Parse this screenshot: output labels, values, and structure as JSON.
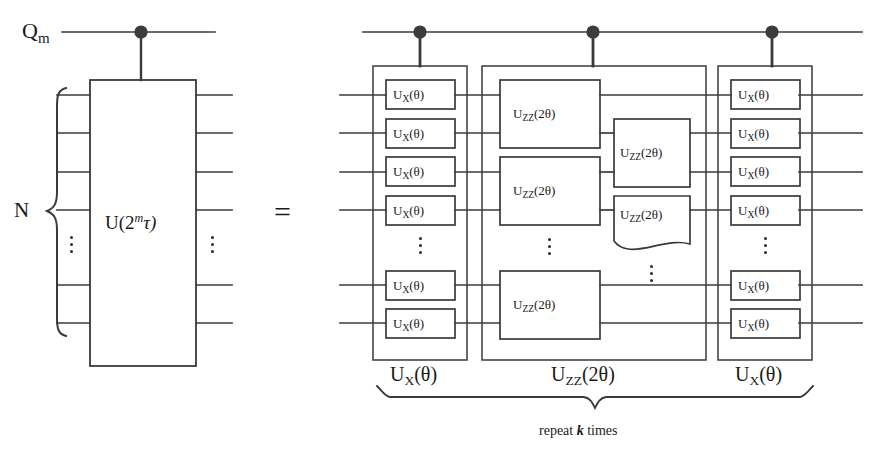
{
  "figure": {
    "type": "quantum-circuit-diagram",
    "equality_symbol": "=",
    "register_brace_label": "N",
    "ancilla_label": {
      "base": "Q",
      "sub": "m"
    },
    "left_block": {
      "gate_label": {
        "base": "U(2",
        "sup": "m",
        "tail": "τ)"
      },
      "plain_text": "U(2^m τ)",
      "wire_count_visible": 6,
      "has_control_dot": true
    },
    "right_block": {
      "columns": [
        {
          "name": "ux-left",
          "group_label_base": "U",
          "group_label_sub": "X",
          "group_label_arg": "(θ)",
          "gate_label_base": "U",
          "gate_label_sub": "X",
          "gate_label_arg": "(θ)",
          "gate_count": 6,
          "has_control_dot": true
        },
        {
          "name": "uzz-middle",
          "group_label_base": "U",
          "group_label_sub": "ZZ",
          "group_label_arg": "(2θ)",
          "gate_label_base": "U",
          "gate_label_sub": "ZZ",
          "gate_label_arg": "(2θ)",
          "gate_count": 5,
          "has_control_dot": true
        },
        {
          "name": "ux-right",
          "group_label_base": "U",
          "group_label_sub": "X",
          "group_label_arg": "(θ)",
          "gate_label_base": "U",
          "gate_label_sub": "X",
          "gate_label_arg": "(θ)",
          "gate_count": 6,
          "has_control_dot": true
        }
      ]
    },
    "repeat_note": {
      "prefix": "repeat ",
      "count": "k",
      "suffix": " times"
    },
    "colors": {
      "ink": "#2a2a2a",
      "wire": "#3a3a3a",
      "background": "#ffffff",
      "control_dot": "#3c3c3c"
    }
  }
}
